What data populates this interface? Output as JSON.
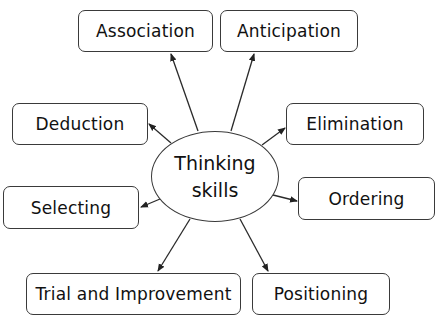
{
  "diagram": {
    "center": {
      "line1": "Thinking",
      "line2": "skills"
    },
    "nodes": [
      {
        "id": "association",
        "label": "Association"
      },
      {
        "id": "anticipation",
        "label": "Anticipation"
      },
      {
        "id": "deduction",
        "label": "Deduction"
      },
      {
        "id": "elimination",
        "label": "Elimination"
      },
      {
        "id": "selecting",
        "label": "Selecting"
      },
      {
        "id": "ordering",
        "label": "Ordering"
      },
      {
        "id": "trial-and-improvement",
        "label": "Trial and Improvement"
      },
      {
        "id": "positioning",
        "label": "Positioning"
      }
    ],
    "edges": [
      {
        "from": "center",
        "to": "association"
      },
      {
        "from": "center",
        "to": "anticipation"
      },
      {
        "from": "center",
        "to": "deduction"
      },
      {
        "from": "center",
        "to": "elimination"
      },
      {
        "from": "center",
        "to": "selecting"
      },
      {
        "from": "center",
        "to": "ordering"
      },
      {
        "from": "center",
        "to": "trial-and-improvement"
      },
      {
        "from": "center",
        "to": "positioning"
      }
    ],
    "colors": {
      "stroke": "#3a3a3a",
      "text": "#111111",
      "background": "#ffffff"
    }
  }
}
